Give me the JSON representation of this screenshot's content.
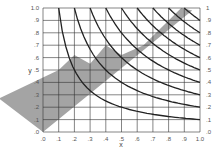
{
  "chart_data": {
    "type": "line",
    "title": "",
    "xlabel": "x",
    "ylabel": "y",
    "xlim": [
      0,
      1.0
    ],
    "ylim": [
      0,
      1.0
    ],
    "grid": true,
    "legend": null,
    "x_ticks": [
      ".0",
      ".1",
      ".2",
      ".3",
      ".4",
      ".5",
      ".6",
      ".7",
      ".8",
      ".9",
      "1.0"
    ],
    "y_ticks_left": [
      ".0",
      ".1",
      ".2",
      ".3",
      ".4",
      ".5",
      ".6",
      ".7",
      ".8",
      ".9",
      "1.0"
    ],
    "y_ticks_right": [
      ".0",
      ".1",
      ".2",
      ".3",
      ".4",
      ".5",
      ".6",
      ".7",
      ".8",
      ".9",
      "1"
    ],
    "series": [
      {
        "name": "curve-1",
        "points": [
          [
            0.1,
            1.0
          ],
          [
            0.2,
            0.55
          ],
          [
            0.3,
            0.38
          ],
          [
            0.4,
            0.3
          ],
          [
            0.5,
            0.24
          ],
          [
            0.6,
            0.2
          ],
          [
            0.7,
            0.17
          ],
          [
            0.8,
            0.14
          ],
          [
            0.9,
            0.12
          ],
          [
            1.0,
            0.1
          ]
        ]
      },
      {
        "name": "curve-2",
        "points": [
          [
            0.2,
            1.0
          ],
          [
            0.3,
            0.68
          ],
          [
            0.4,
            0.52
          ],
          [
            0.5,
            0.42
          ],
          [
            0.6,
            0.35
          ],
          [
            0.7,
            0.3
          ],
          [
            0.8,
            0.26
          ],
          [
            0.9,
            0.23
          ],
          [
            1.0,
            0.2
          ]
        ]
      },
      {
        "name": "curve-3",
        "points": [
          [
            0.3,
            1.0
          ],
          [
            0.4,
            0.76
          ],
          [
            0.5,
            0.61
          ],
          [
            0.6,
            0.5
          ],
          [
            0.7,
            0.43
          ],
          [
            0.8,
            0.38
          ],
          [
            0.9,
            0.33
          ],
          [
            1.0,
            0.3
          ]
        ]
      },
      {
        "name": "curve-4",
        "points": [
          [
            0.4,
            1.0
          ],
          [
            0.5,
            0.8
          ],
          [
            0.6,
            0.67
          ],
          [
            0.7,
            0.57
          ],
          [
            0.8,
            0.5
          ],
          [
            0.9,
            0.45
          ],
          [
            1.0,
            0.4
          ]
        ]
      },
      {
        "name": "curve-5",
        "points": [
          [
            0.5,
            1.0
          ],
          [
            0.6,
            0.83
          ],
          [
            0.7,
            0.71
          ],
          [
            0.8,
            0.62
          ],
          [
            0.9,
            0.55
          ],
          [
            1.0,
            0.5
          ]
        ]
      },
      {
        "name": "curve-6",
        "points": [
          [
            0.6,
            1.0
          ],
          [
            0.7,
            0.86
          ],
          [
            0.8,
            0.75
          ],
          [
            0.9,
            0.67
          ],
          [
            1.0,
            0.6
          ]
        ]
      },
      {
        "name": "curve-7",
        "points": [
          [
            0.7,
            1.0
          ],
          [
            0.8,
            0.88
          ],
          [
            0.9,
            0.78
          ],
          [
            1.0,
            0.7
          ]
        ]
      },
      {
        "name": "curve-8",
        "points": [
          [
            0.8,
            1.0
          ],
          [
            0.9,
            0.89
          ],
          [
            1.0,
            0.8
          ]
        ]
      },
      {
        "name": "curve-9",
        "points": [
          [
            0.9,
            1.0
          ],
          [
            1.0,
            0.9
          ]
        ]
      }
    ],
    "shaded_region": {
      "color": "#9a9a9a",
      "polygon": [
        [
          0.0,
          0.0
        ],
        [
          0.95,
          0.98
        ],
        [
          0.88,
          1.0
        ],
        [
          0.64,
          0.7
        ],
        [
          0.5,
          0.62
        ],
        [
          0.4,
          0.7
        ],
        [
          0.3,
          0.55
        ],
        [
          0.2,
          0.62
        ],
        [
          0.1,
          0.5
        ],
        [
          -0.28,
          0.27
        ]
      ]
    },
    "colors": {
      "curve": "#222222",
      "grid": "#333333",
      "shade": "#9a9a9a",
      "background": "#ffffff"
    }
  }
}
